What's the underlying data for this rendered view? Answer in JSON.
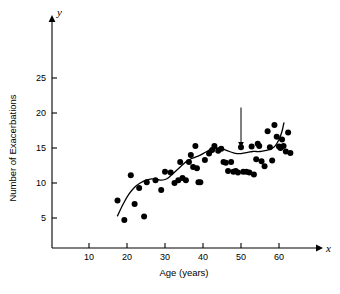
{
  "chart_data": {
    "type": "scatter",
    "title": "",
    "xlabel": "Age (years)",
    "ylabel": "Number of Exacerbations",
    "x_axis_letter": "x",
    "y_axis_letter": "y",
    "xlim": [
      5,
      68
    ],
    "ylim": [
      0,
      27
    ],
    "xticks": [
      10,
      20,
      30,
      40,
      50,
      60
    ],
    "xtick_labels": [
      "10",
      "20",
      "30",
      "40",
      "50",
      "60"
    ],
    "yticks": [
      5,
      10,
      15,
      20,
      25
    ],
    "ytick_labels": [
      "5",
      "10",
      "15",
      "20",
      "25"
    ],
    "grid": false,
    "legend": null,
    "annotations": [
      {
        "text": "S(x)",
        "name": "smoother-label",
        "x": 50,
        "y": 21.5,
        "arrow_to_x": 50,
        "arrow_to_y": 15.0
      }
    ],
    "series": [
      {
        "name": "observations",
        "type": "scatter",
        "marker": "filled-circle",
        "color": "#000000",
        "points": [
          [
            17.5,
            7.5
          ],
          [
            19.3,
            4.7
          ],
          [
            21.0,
            11.1
          ],
          [
            22.0,
            7.0
          ],
          [
            23.2,
            9.3
          ],
          [
            24.5,
            5.2
          ],
          [
            25.2,
            10.1
          ],
          [
            27.5,
            10.4
          ],
          [
            29.0,
            9.0
          ],
          [
            30.0,
            11.6
          ],
          [
            31.5,
            11.5
          ],
          [
            32.5,
            10.0
          ],
          [
            33.5,
            10.4
          ],
          [
            34.0,
            13.0
          ],
          [
            34.6,
            10.7
          ],
          [
            35.5,
            10.4
          ],
          [
            36.3,
            13.0
          ],
          [
            36.8,
            14.0
          ],
          [
            37.4,
            12.3
          ],
          [
            38.0,
            15.3
          ],
          [
            38.4,
            12.1
          ],
          [
            38.8,
            10.1
          ],
          [
            39.3,
            10.1
          ],
          [
            40.5,
            13.3
          ],
          [
            41.6,
            14.2
          ],
          [
            42.4,
            14.7
          ],
          [
            43.0,
            15.3
          ],
          [
            44.0,
            14.6
          ],
          [
            44.8,
            14.9
          ],
          [
            45.4,
            13.0
          ],
          [
            46.0,
            12.9
          ],
          [
            46.6,
            11.7
          ],
          [
            47.4,
            13.0
          ],
          [
            48.0,
            11.6
          ],
          [
            48.6,
            11.7
          ],
          [
            49.2,
            11.5
          ],
          [
            50.0,
            15.1
          ],
          [
            50.6,
            11.6
          ],
          [
            51.4,
            11.6
          ],
          [
            52.2,
            11.5
          ],
          [
            52.8,
            15.2
          ],
          [
            53.4,
            11.2
          ],
          [
            54.0,
            13.4
          ],
          [
            54.4,
            15.6
          ],
          [
            54.8,
            15.3
          ],
          [
            55.4,
            13.1
          ],
          [
            56.2,
            12.4
          ],
          [
            57.0,
            17.4
          ],
          [
            57.6,
            15.1
          ],
          [
            58.2,
            13.2
          ],
          [
            58.8,
            18.3
          ],
          [
            59.4,
            16.6
          ],
          [
            60.0,
            15.2
          ],
          [
            60.4,
            15.0
          ],
          [
            60.8,
            16.2
          ],
          [
            61.2,
            15.3
          ],
          [
            61.8,
            14.5
          ],
          [
            62.4,
            17.2
          ],
          [
            63.0,
            14.3
          ]
        ]
      },
      {
        "name": "S(x)",
        "type": "line",
        "color": "#000000",
        "points": [
          [
            17.5,
            5.3
          ],
          [
            19.0,
            7.0
          ],
          [
            20.5,
            8.4
          ],
          [
            22.0,
            9.4
          ],
          [
            23.5,
            10.0
          ],
          [
            25.0,
            10.4
          ],
          [
            26.5,
            10.6
          ],
          [
            28.0,
            10.5
          ],
          [
            29.0,
            10.4
          ],
          [
            30.0,
            10.5
          ],
          [
            31.0,
            10.8
          ],
          [
            32.0,
            11.3
          ],
          [
            33.0,
            11.8
          ],
          [
            34.0,
            12.3
          ],
          [
            35.0,
            12.8
          ],
          [
            36.0,
            13.2
          ],
          [
            37.0,
            13.5
          ],
          [
            38.0,
            13.7
          ],
          [
            39.0,
            13.9
          ],
          [
            40.0,
            14.2
          ],
          [
            41.0,
            14.5
          ],
          [
            42.0,
            14.8
          ],
          [
            43.0,
            14.9
          ],
          [
            44.0,
            15.0
          ],
          [
            45.0,
            14.9
          ],
          [
            46.0,
            14.7
          ],
          [
            47.0,
            14.5
          ],
          [
            48.0,
            14.3
          ],
          [
            49.0,
            14.2
          ],
          [
            50.0,
            14.2
          ],
          [
            51.0,
            14.3
          ],
          [
            52.0,
            14.4
          ],
          [
            53.0,
            14.5
          ],
          [
            54.0,
            14.5
          ],
          [
            55.0,
            14.5
          ],
          [
            56.0,
            14.6
          ],
          [
            57.0,
            14.7
          ],
          [
            58.0,
            14.9
          ],
          [
            59.0,
            15.3
          ],
          [
            60.0,
            16.2
          ],
          [
            60.8,
            17.4
          ],
          [
            61.3,
            18.6
          ]
        ]
      }
    ]
  }
}
